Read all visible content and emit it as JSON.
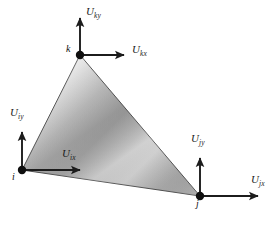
{
  "figure": {
    "background_color": "#ffffff",
    "element": {
      "name": "triangular-element",
      "shape": "triangle",
      "fill_light": "#e2e2e2",
      "fill_mid": "#a9a9a9",
      "fill_dark": "#8f8f8f",
      "edge_color": "#3a3a3a",
      "vertices": [
        {
          "id": "k",
          "x": 80,
          "y": 55
        },
        {
          "id": "i",
          "x": 22,
          "y": 170
        },
        {
          "id": "j",
          "x": 200,
          "y": 196
        }
      ]
    },
    "nodes": [
      {
        "id": "node-k",
        "label": "k",
        "x": 80,
        "y": 55,
        "label_x": 66,
        "label_y": 48,
        "dot_radius": 4.2
      },
      {
        "id": "node-i",
        "label": "i",
        "x": 22,
        "y": 170,
        "label_x": 13,
        "label_y": 174,
        "dot_radius": 4.2
      },
      {
        "id": "node-j",
        "label": "j",
        "x": 200,
        "y": 196,
        "label_x": 196,
        "label_y": 201,
        "dot_radius": 4.2
      }
    ],
    "vectors": [
      {
        "id": "vector-ky",
        "symbol": "U",
        "subscript": "ky",
        "node": "k",
        "direction": "up",
        "from_x": 80,
        "from_y": 55,
        "to_x": 80,
        "to_y": 14,
        "label_x": 86,
        "label_y": 11
      },
      {
        "id": "vector-kx",
        "symbol": "U",
        "subscript": "kx",
        "node": "k",
        "direction": "right",
        "from_x": 80,
        "from_y": 55,
        "to_x": 128,
        "to_y": 55,
        "label_x": 132,
        "label_y": 49
      },
      {
        "id": "vector-iy",
        "symbol": "U",
        "subscript": "iy",
        "node": "i",
        "direction": "up",
        "from_x": 22,
        "from_y": 170,
        "to_x": 22,
        "to_y": 128,
        "label_x": 11,
        "label_y": 112
      },
      {
        "id": "vector-ix",
        "symbol": "U",
        "subscript": "ix",
        "node": "i",
        "direction": "right",
        "from_x": 22,
        "from_y": 170,
        "to_x": 84,
        "to_y": 170,
        "label_x": 63,
        "label_y": 152
      },
      {
        "id": "vector-jy",
        "symbol": "U",
        "subscript": "jy",
        "node": "j",
        "direction": "up",
        "from_x": 200,
        "from_y": 196,
        "to_x": 200,
        "to_y": 154,
        "label_x": 192,
        "label_y": 138
      },
      {
        "id": "vector-jx",
        "symbol": "U",
        "subscript": "jx",
        "node": "j",
        "direction": "right",
        "from_x": 200,
        "from_y": 196,
        "to_x": 262,
        "to_y": 196,
        "label_x": 252,
        "label_y": 179
      }
    ]
  }
}
